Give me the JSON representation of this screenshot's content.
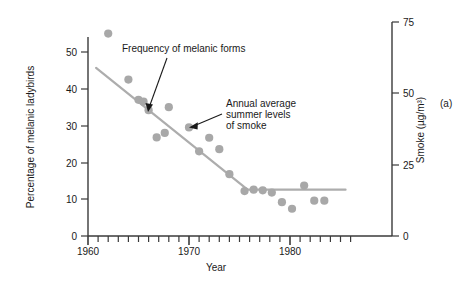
{
  "panel": {
    "label": "(a)"
  },
  "chart_data": {
    "type": "scatter",
    "title": "",
    "xlabel": "Year",
    "ylabel": "Percentage of melanic ladybirds",
    "y2label": "Smoke (µg/m³)",
    "xlim": [
      1959,
      1986.5
    ],
    "ylim": [
      0,
      56
    ],
    "y2lim": [
      0,
      78
    ],
    "xticks": [
      1960,
      1970,
      1980
    ],
    "xticklabels": [
      "1960",
      "1970",
      "1980"
    ],
    "xminor_from": 1960,
    "xminor_to": 1986,
    "yticks": [
      0,
      10,
      20,
      30,
      40,
      50
    ],
    "yticklabels": [
      "0",
      "10",
      "20",
      "30",
      "40",
      "50"
    ],
    "y2ticks": [
      0,
      25,
      50,
      75
    ],
    "y2ticklabels": [
      "0",
      "25",
      "50",
      "75"
    ],
    "grid": false,
    "legend": "none",
    "series": [
      {
        "name": "Percentage of melanic ladybirds",
        "marker": "circle",
        "color": "#a8a8a8",
        "points": [
          {
            "x": 1962.0,
            "y": 55.0
          },
          {
            "x": 1964.0,
            "y": 42.5
          },
          {
            "x": 1965.0,
            "y": 37.0
          },
          {
            "x": 1965.5,
            "y": 36.5
          },
          {
            "x": 1966.0,
            "y": 34.2
          },
          {
            "x": 1966.8,
            "y": 26.8
          },
          {
            "x": 1967.6,
            "y": 28.0
          },
          {
            "x": 1968.0,
            "y": 35.0
          },
          {
            "x": 1970.0,
            "y": 29.5
          },
          {
            "x": 1971.0,
            "y": 23.0
          },
          {
            "x": 1972.0,
            "y": 26.7
          },
          {
            "x": 1973.0,
            "y": 23.6
          },
          {
            "x": 1974.0,
            "y": 16.8
          },
          {
            "x": 1975.5,
            "y": 12.2
          },
          {
            "x": 1976.4,
            "y": 12.6
          },
          {
            "x": 1977.3,
            "y": 12.4
          },
          {
            "x": 1978.2,
            "y": 11.8
          },
          {
            "x": 1979.2,
            "y": 9.2
          },
          {
            "x": 1980.2,
            "y": 7.4
          },
          {
            "x": 1981.4,
            "y": 13.7
          },
          {
            "x": 1982.4,
            "y": 9.6
          },
          {
            "x": 1983.4,
            "y": 9.6
          }
        ]
      },
      {
        "name": "Annual average summer levels of smoke",
        "marker": "line",
        "color": "#adadad",
        "points": [
          {
            "x": 1960.8,
            "y": 45.7
          },
          {
            "x": 1975.8,
            "y": 12.6
          },
          {
            "x": 1985.5,
            "y": 12.6
          }
        ]
      }
    ],
    "annotations": [
      {
        "id": "melanic",
        "text_lines": [
          "Frequency of melanic forms"
        ],
        "text_x": 122,
        "text_y": 52,
        "arrow_from_x": 167,
        "arrow_from_y": 58,
        "arrow_to_x": 148,
        "arrow_to_y": 111
      },
      {
        "id": "smoke",
        "text_lines": [
          "Annual average",
          "summer levels",
          "of smoke"
        ],
        "text_x": 226,
        "text_y": 107,
        "arrow_from_x": 222,
        "arrow_from_y": 115,
        "arrow_to_x": 190,
        "arrow_to_y": 127
      }
    ]
  }
}
